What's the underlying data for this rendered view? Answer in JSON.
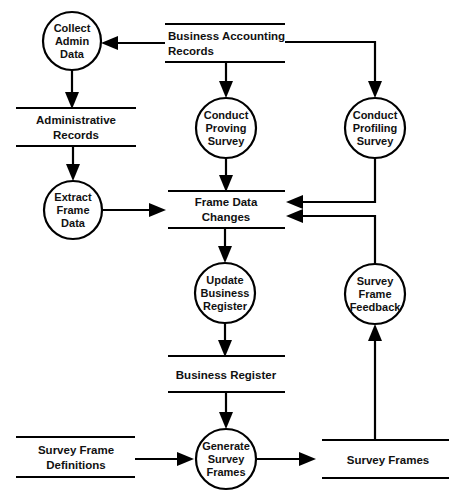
{
  "diagram": {
    "type": "data-flow-diagram",
    "processes": [
      {
        "id": "collect-admin-data",
        "label_lines": [
          "Collect",
          "Admin",
          "Data"
        ],
        "cx": 72,
        "cy": 41,
        "r": 29
      },
      {
        "id": "extract-frame-data",
        "label_lines": [
          "Extract",
          "Frame",
          "Data"
        ],
        "cx": 73,
        "cy": 210,
        "r": 29
      },
      {
        "id": "conduct-proving-survey",
        "label_lines": [
          "Conduct",
          "Proving",
          "Survey"
        ],
        "cx": 226,
        "cy": 128,
        "r": 30
      },
      {
        "id": "conduct-profiling-survey",
        "label_lines": [
          "Conduct",
          "Profiling",
          "Survey"
        ],
        "cx": 375,
        "cy": 128,
        "r": 30
      },
      {
        "id": "update-business-register",
        "label_lines": [
          "Update",
          "Business",
          "Register"
        ],
        "cx": 225,
        "cy": 293,
        "r": 30
      },
      {
        "id": "survey-frame-feedback",
        "label_lines": [
          "Survey",
          "Frame",
          "Feedback"
        ],
        "cx": 375,
        "cy": 294,
        "r": 30
      },
      {
        "id": "generate-survey-frames",
        "label_lines": [
          "Generate",
          "Survey",
          "Frames"
        ],
        "cx": 226,
        "cy": 459,
        "r": 30
      }
    ],
    "stores": [
      {
        "id": "administrative-records",
        "label_lines": [
          "Administrative",
          "Records"
        ],
        "x1": 16,
        "x2": 136,
        "top": 108,
        "bottom": 146,
        "align": "center"
      },
      {
        "id": "business-accounting-records",
        "label_lines": [
          "Business Accounting",
          "Records"
        ],
        "x1": 165,
        "x2": 285,
        "top": 24,
        "bottom": 62,
        "align": "left"
      },
      {
        "id": "frame-data-changes",
        "label_lines": [
          "Frame Data",
          "Changes"
        ],
        "x1": 168,
        "x2": 285,
        "top": 191,
        "bottom": 228,
        "align": "center"
      },
      {
        "id": "business-register",
        "label_lines": [
          "Business Register"
        ],
        "x1": 168,
        "x2": 285,
        "top": 356,
        "bottom": 392,
        "align": "center"
      },
      {
        "id": "survey-frame-definitions",
        "label_lines": [
          "Survey Frame",
          "Definitions"
        ],
        "x1": 16,
        "x2": 135,
        "top": 437,
        "bottom": 477,
        "align": "center"
      },
      {
        "id": "survey-frames",
        "label_lines": [
          "Survey Frames"
        ],
        "x1": 322,
        "x2": 449,
        "top": 440,
        "bottom": 478,
        "align": "center"
      }
    ],
    "flows": [
      {
        "id": "flow-bar-to-collect-admin",
        "from": "business-accounting-records",
        "to": "collect-admin-data"
      },
      {
        "id": "flow-collect-admin-to-admin-recs",
        "from": "collect-admin-data",
        "to": "administrative-records"
      },
      {
        "id": "flow-admin-recs-to-extract",
        "from": "administrative-records",
        "to": "extract-frame-data"
      },
      {
        "id": "flow-extract-to-frame-changes",
        "from": "extract-frame-data",
        "to": "frame-data-changes"
      },
      {
        "id": "flow-bar-to-proving-survey",
        "from": "business-accounting-records",
        "to": "conduct-proving-survey"
      },
      {
        "id": "flow-bar-to-profiling-survey",
        "from": "business-accounting-records",
        "to": "conduct-profiling-survey"
      },
      {
        "id": "flow-proving-to-frame-changes",
        "from": "conduct-proving-survey",
        "to": "frame-data-changes"
      },
      {
        "id": "flow-profiling-to-frame-changes",
        "from": "conduct-profiling-survey",
        "to": "frame-data-changes"
      },
      {
        "id": "flow-feedback-to-frame-changes",
        "from": "survey-frame-feedback",
        "to": "frame-data-changes"
      },
      {
        "id": "flow-frame-changes-to-update",
        "from": "frame-data-changes",
        "to": "update-business-register"
      },
      {
        "id": "flow-update-to-business-register",
        "from": "update-business-register",
        "to": "business-register"
      },
      {
        "id": "flow-business-register-to-generate",
        "from": "business-register",
        "to": "generate-survey-frames"
      },
      {
        "id": "flow-definitions-to-generate",
        "from": "survey-frame-definitions",
        "to": "generate-survey-frames"
      },
      {
        "id": "flow-generate-to-survey-frames",
        "from": "generate-survey-frames",
        "to": "survey-frames"
      },
      {
        "id": "flow-survey-frames-to-feedback",
        "from": "survey-frames",
        "to": "survey-frame-feedback"
      }
    ],
    "colors": {
      "stroke": "#000000",
      "background": "#ffffff",
      "text": "#111111"
    }
  }
}
